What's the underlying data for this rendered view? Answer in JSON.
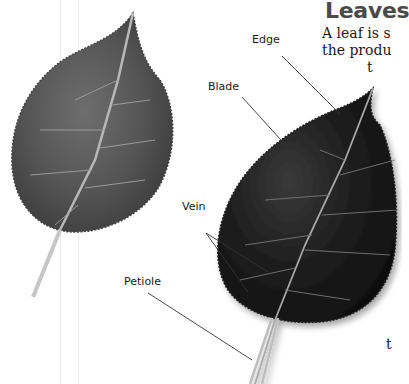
{
  "page": {
    "heading": "Leaves",
    "body_lines": [
      "A leaf is s",
      "the produ",
      "t",
      "t"
    ]
  },
  "figure": {
    "labels": {
      "edge": "Edge",
      "blade": "Blade",
      "vein": "Vein",
      "petiole": "Petiole"
    },
    "colors": {
      "leaf_light": "#5a5a5a",
      "leaf_dark": "#1c1c1c",
      "leader_line": "#333333",
      "heading": "#4a4a4a"
    }
  }
}
